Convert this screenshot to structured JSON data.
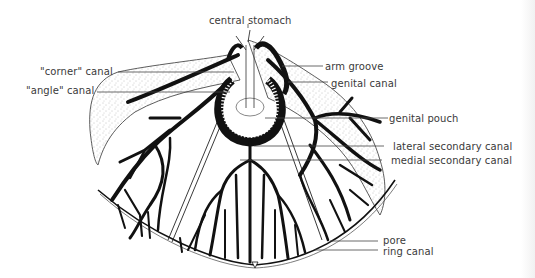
{
  "diagram": {
    "type": "anatomical line drawing",
    "colors": {
      "ink": "#111111",
      "label_text": "#3a3a3a",
      "leader_line": "#444444",
      "stipple": "#8a8a8a",
      "background": "#ffffff"
    }
  },
  "labels": {
    "central_stomach": "central stomach",
    "corner_canal": "\"corner\" canal",
    "angle_canal": "\"angle\" canal",
    "arm_groove": "arm groove",
    "genital_canal": "genital canal",
    "genital_pouch": "genital pouch",
    "lateral_secondary_canal": "lateral secondary canal",
    "medial_secondary_canal": "medial secondary canal",
    "pore": "pore",
    "ring_canal": "ring canal"
  }
}
